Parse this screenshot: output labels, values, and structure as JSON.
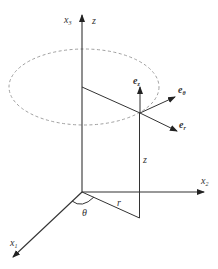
{
  "diagram": {
    "axes": {
      "x1": {
        "label": "x",
        "sub": "1"
      },
      "x2": {
        "label": "x",
        "sub": "2"
      },
      "x3": {
        "label": "x",
        "sub": "3"
      },
      "z_axis_label": "z"
    },
    "vectors": {
      "ez": {
        "label": "e",
        "sub": "z"
      },
      "etheta": {
        "label": "e",
        "sub": "θ"
      },
      "er": {
        "label": "e",
        "sub": "r"
      }
    },
    "quantities": {
      "height": "z",
      "radius": "r",
      "angle": "θ"
    },
    "colors": {
      "lines": "#333333",
      "dashed_circle": "#a0a0a0",
      "background": "#ffffff"
    }
  }
}
